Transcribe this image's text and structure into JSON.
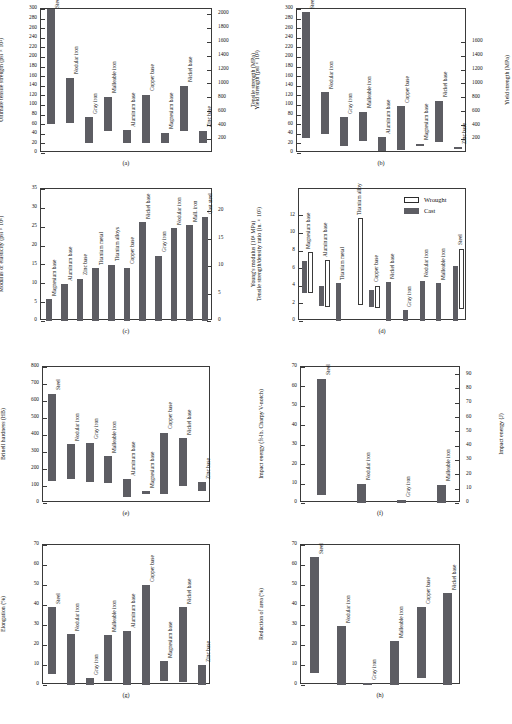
{
  "figure": {
    "background": "#ffffff",
    "bar_color": "#5d5d63",
    "axis_color": "#3a3a3a"
  },
  "chart_data": [
    {
      "id": "a",
      "type": "bar",
      "caption": "(a)",
      "title": "",
      "ylabel": "Ultimate tensile strength (psi × 10³)",
      "ylabel_right": "Tensile strength (MPa)",
      "xlabel": "",
      "ylim": [
        0,
        300
      ],
      "yticks": [
        0,
        20,
        40,
        60,
        80,
        100,
        120,
        140,
        160,
        180,
        200,
        220,
        240,
        260,
        280,
        300
      ],
      "ylim_right": [
        0,
        2070
      ],
      "yticks_right": [
        200,
        400,
        600,
        800,
        1000,
        1200,
        1400,
        1600,
        1800,
        2000
      ],
      "range_bars": true,
      "categories": [
        "Steel",
        "Nodular iron",
        "Gray iron",
        "Malleable iron",
        "Aluminum base",
        "Copper base",
        "Magnesium base",
        "Nickel base",
        "Zinc base"
      ],
      "low": [
        60,
        62,
        20,
        46,
        20,
        21,
        20,
        46,
        20
      ],
      "high": [
        300,
        157,
        75,
        117,
        47,
        121,
        42,
        140,
        46
      ]
    },
    {
      "id": "b",
      "type": "bar",
      "caption": "(b)",
      "title": "",
      "ylabel": "Yield strength (psi × 10³)",
      "ylabel_right": "Yield strength (MPa)",
      "xlabel": "",
      "ylim": [
        0,
        300
      ],
      "yticks": [
        0,
        20,
        40,
        60,
        80,
        100,
        120,
        140,
        160,
        180,
        200,
        220,
        240,
        260,
        280,
        300
      ],
      "ylim_right": [
        0,
        2070
      ],
      "yticks_right": [
        200,
        400,
        600,
        800,
        1000,
        1200,
        1400,
        1600
      ],
      "range_bars": true,
      "categories": [
        "Steel",
        "Nodular iron",
        "Gray iron",
        "Malleable iron",
        "Aluminum base",
        "Copper base",
        "Magnesium base",
        "Nickel base",
        "Zinc base"
      ],
      "low": [
        32,
        40,
        14,
        24,
        4,
        7,
        14,
        23,
        8
      ],
      "high": [
        293,
        127,
        74,
        86,
        33,
        97,
        19,
        109,
        12
      ]
    },
    {
      "id": "c",
      "type": "bar",
      "caption": "(c)",
      "title": "",
      "ylabel": "Modulus of elasticity (psi × 10⁶)",
      "ylabel_right": "Young's modulus (10⁴ MPa)",
      "xlabel": "",
      "ylim": [
        0,
        35
      ],
      "yticks": [
        0,
        5,
        10,
        15,
        20,
        25,
        30,
        35
      ],
      "ylim_right": [
        0,
        24
      ],
      "yticks_right": [
        0,
        5,
        10,
        15,
        20
      ],
      "range_bars": false,
      "categories": [
        "Magnesium base",
        "Aluminum base",
        "Zinc base",
        "Titanium metal",
        "Titanium alloys",
        "Copper base",
        "Nickel base",
        "Gray iron",
        "Nodular iron",
        "Mall. iron",
        "Cast steel"
      ],
      "values": [
        5.8,
        9.7,
        11.2,
        14.0,
        14.9,
        14.1,
        26.2,
        17.3,
        24.6,
        25.4,
        27.5
      ]
    },
    {
      "id": "d",
      "type": "bar",
      "caption": "(d)",
      "title": "",
      "ylabel": "Tensile strength/density ratio (in. × 10⁵)",
      "ylabel_right": "",
      "xlabel": "",
      "ylim": [
        0,
        15
      ],
      "yticks": [
        0,
        2,
        4,
        6,
        8,
        10,
        12
      ],
      "range_bars": true,
      "legend": [
        {
          "label": "Wrought",
          "style": "open"
        },
        {
          "label": "Cast",
          "style": "fill"
        }
      ],
      "legend_position": "top-right",
      "categories": [
        "Magnesium base",
        "Aluminum base",
        "Titanium metal",
        "Titanium alloy",
        "Copper base",
        "Nickel base",
        "Gray iron",
        "Nodular iron",
        "Malleable iron",
        "Steel"
      ],
      "series": [
        {
          "name": "Cast",
          "style": "fill",
          "low": [
            3.2,
            1.7,
            0.0,
            0.0,
            1.6,
            0.0,
            0.0,
            0.0,
            0.0,
            0.0
          ],
          "high": [
            6.8,
            4.0,
            4.3,
            0.0,
            3.5,
            4.4,
            1.2,
            4.6,
            4.3,
            6.2
          ]
        },
        {
          "name": "Wrought",
          "style": "open",
          "low": [
            3.2,
            1.6,
            0.0,
            1.8,
            1.5,
            0.0,
            0.0,
            0.0,
            0.0,
            1.4
          ],
          "high": [
            7.8,
            6.9,
            0.0,
            11.7,
            4.0,
            0.0,
            0.0,
            0.0,
            0.0,
            8.2
          ]
        }
      ]
    },
    {
      "id": "e",
      "type": "bar",
      "caption": "(e)",
      "title": "",
      "ylabel": "Brinell hardness (HB)",
      "ylabel_right": "",
      "xlabel": "",
      "ylim": [
        0,
        800
      ],
      "yticks": [
        0,
        100,
        200,
        300,
        400,
        500,
        600,
        700,
        800
      ],
      "range_bars": true,
      "categories": [
        "Steel",
        "Nodular iron",
        "Gray iron",
        "Malleable iron",
        "Aluminum base",
        "Magnesium base",
        "Copper base",
        "Nickel base",
        "Zinc base"
      ],
      "low": [
        131,
        140,
        126,
        120,
        38,
        55,
        51,
        102,
        70
      ],
      "high": [
        643,
        345,
        355,
        276,
        140,
        70,
        412,
        381,
        122
      ]
    },
    {
      "id": "f",
      "type": "bar",
      "caption": "(f)",
      "title": "",
      "ylabel": "Impact energy (ft-lb, Charpy V-notch)",
      "ylabel_right": "Impact energy (J)",
      "xlabel": "",
      "ylim": [
        0,
        70
      ],
      "yticks": [
        0,
        10,
        20,
        30,
        40,
        50,
        60,
        70
      ],
      "ylim_right": [
        0,
        95
      ],
      "yticks_right": [
        0,
        10,
        20,
        30,
        40,
        50,
        60,
        70,
        80,
        90
      ],
      "range_bars": true,
      "categories": [
        "Steel",
        "Nodular iron",
        "Gray iron",
        "Malleable iron"
      ],
      "low": [
        4,
        0,
        0,
        0
      ],
      "high": [
        64,
        10,
        1.5,
        9.5
      ]
    },
    {
      "id": "g",
      "type": "bar",
      "caption": "(g)",
      "title": "",
      "ylabel": "Elongation (%)",
      "ylabel_right": "",
      "xlabel": "",
      "ylim": [
        0,
        70
      ],
      "yticks": [
        0,
        10,
        20,
        30,
        40,
        50,
        60,
        70
      ],
      "range_bars": true,
      "categories": [
        "Steel",
        "Nodular iron",
        "Gray iron",
        "Malleable iron",
        "Aluminum base",
        "Copper base",
        "Magnesium base",
        "Nickel base",
        "Zinc base"
      ],
      "low": [
        5.5,
        0,
        0,
        2,
        0,
        0,
        2,
        1.5,
        0
      ],
      "high": [
        39,
        25.5,
        3.5,
        25,
        27,
        50,
        12,
        39,
        10
      ]
    },
    {
      "id": "h",
      "type": "bar",
      "caption": "(h)",
      "title": "",
      "ylabel": "Reduction of area (%)",
      "ylabel_right": "",
      "xlabel": "",
      "ylim": [
        0,
        70
      ],
      "yticks": [
        0,
        10,
        20,
        30,
        40,
        50,
        60,
        70
      ],
      "range_bars": true,
      "categories": [
        "Steel",
        "Nodular iron",
        "Gray iron",
        "Malleable iron",
        "Copper base",
        "Nickel base"
      ],
      "low": [
        6,
        0,
        0,
        0,
        3.5,
        0
      ],
      "high": [
        64,
        29.5,
        0.8,
        22,
        39,
        46
      ]
    }
  ]
}
